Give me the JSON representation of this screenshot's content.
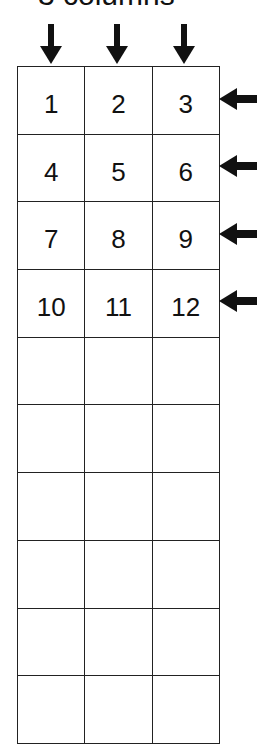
{
  "title": "3 columns",
  "grid": {
    "columns": 3,
    "rows": [
      [
        "1",
        "2",
        "3"
      ],
      [
        "4",
        "5",
        "6"
      ],
      [
        "7",
        "8",
        "9"
      ],
      [
        "10",
        "11",
        "12"
      ],
      [
        "",
        "",
        ""
      ],
      [
        "",
        "",
        ""
      ],
      [
        "",
        "",
        ""
      ],
      [
        "",
        "",
        ""
      ],
      [
        "",
        "",
        ""
      ],
      [
        "",
        "",
        ""
      ]
    ]
  },
  "arrows": {
    "column_arrows": 3,
    "row_arrows": 4,
    "color": "#111111"
  }
}
